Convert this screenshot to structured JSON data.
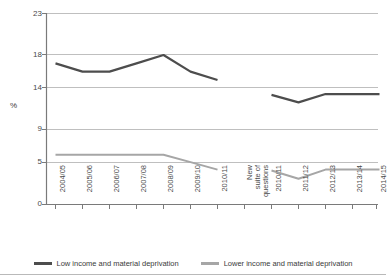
{
  "chart_data": {
    "type": "line",
    "title": "",
    "subtitle": "",
    "xlabel": "",
    "ylabel": "%",
    "ylim": [
      0,
      23
    ],
    "yticks": [
      0,
      5,
      9,
      14,
      18,
      23
    ],
    "ytick_labels": [
      "0",
      "5",
      "9",
      "14",
      "18",
      "23"
    ],
    "grid": "horizontal",
    "legend_position": "bottom",
    "categories": [
      "2004/05",
      "2005/06",
      "2006/07",
      "2007/08",
      "2008/09",
      "2009/10",
      "2010/11",
      "New suite of questions",
      "2010/11",
      "2011/12",
      "2012/13",
      "2013/14",
      "2014/15"
    ],
    "break_label": "New suite of questions",
    "break_label_lines": [
      "New",
      "suite of",
      "questions"
    ],
    "break_index": 7,
    "series": [
      {
        "name": "Low income and material deprivation",
        "color": "#4d4d4d",
        "values": [
          17.0,
          16.0,
          16.0,
          17.0,
          18.0,
          16.0,
          15.0,
          null,
          13.2,
          12.3,
          13.3,
          13.3,
          13.3
        ]
      },
      {
        "name": "Lower income and material deprivation",
        "color": "#a6a6a6",
        "values": [
          6.0,
          6.0,
          6.0,
          6.0,
          6.0,
          5.1,
          4.2,
          null,
          4.1,
          3.1,
          4.2,
          4.2,
          4.2
        ]
      }
    ],
    "legend": [
      {
        "label": "Low income and material deprivation",
        "color": "#4d4d4d"
      },
      {
        "label": "Lower income and material deprivation",
        "color": "#a6a6a6"
      }
    ]
  },
  "axis": {
    "y_title": "%",
    "y_labels": [
      "23",
      "18",
      "14",
      "9",
      "5",
      "0"
    ],
    "x_labels": [
      "2004/05",
      "2005/06",
      "2006/07",
      "2007/08",
      "2008/09",
      "2009/10",
      "2010/11",
      "2010/11",
      "2011/12",
      "2012/13",
      "2013/14",
      "2014/15"
    ],
    "break_lines": [
      "New",
      "suite of",
      "questions"
    ]
  }
}
